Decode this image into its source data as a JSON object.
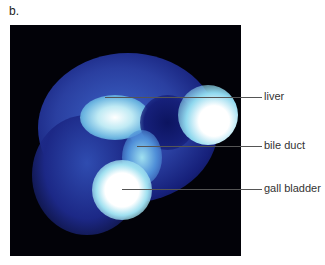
{
  "figure": {
    "panel_label": "b.",
    "image_description": "scintigraphy scan of liver, bile duct and gall bladder",
    "annotations": [
      {
        "label": "liver"
      },
      {
        "label": "bile duct"
      },
      {
        "label": "gall bladder"
      }
    ],
    "colors": {
      "background": "#020208",
      "dark_blue": "#1e2a8c",
      "mid_blue": "#3c64c8",
      "light_blue": "#7ecfe6",
      "hot": "#ffffff",
      "leader": "#555555"
    }
  }
}
